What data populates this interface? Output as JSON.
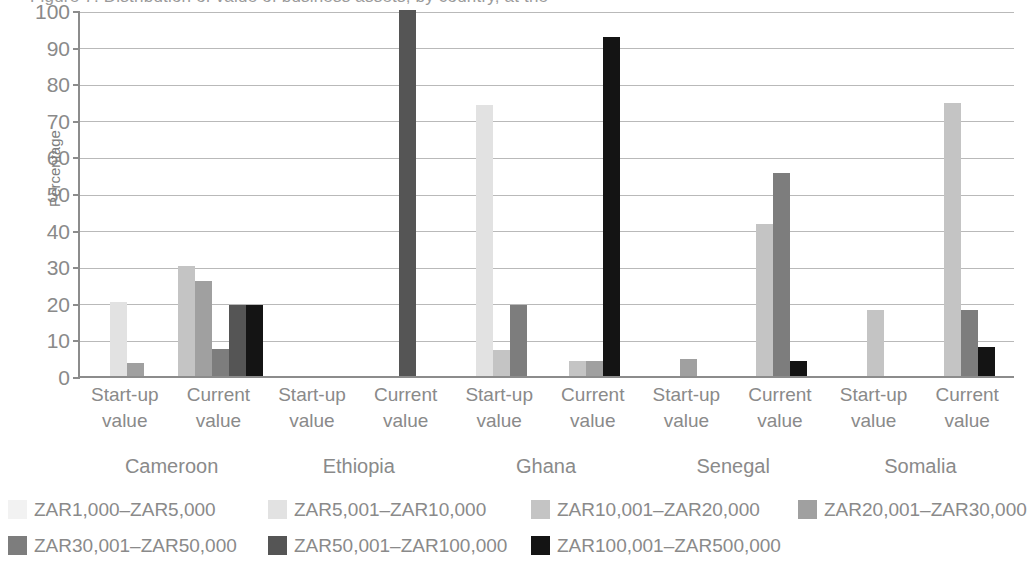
{
  "chart_data": {
    "type": "bar",
    "title": "Figure 7: Distribution of value of business assets, by country, at the",
    "xlabel": "",
    "ylabel": "Percentage",
    "ylim": [
      0,
      100
    ],
    "ytick_labels": [
      "0",
      "10",
      "20",
      "30",
      "40",
      "50",
      "60",
      "70",
      "80",
      "90",
      "100"
    ],
    "grid": true,
    "legend_position": "bottom",
    "series": [
      {
        "name": "ZAR1,000–ZAR5,000",
        "color": "#f2f2f2"
      },
      {
        "name": "ZAR5,001–ZAR10,000",
        "color": "#e2e2e2"
      },
      {
        "name": "ZAR10,001–ZAR20,000",
        "color": "#c4c4c4"
      },
      {
        "name": "ZAR20,001–ZAR30,000",
        "color": "#a0a0a0"
      },
      {
        "name": "ZAR30,001–ZAR50,000",
        "color": "#7d7d7d"
      },
      {
        "name": "ZAR50,001–ZAR100,000",
        "color": "#555555"
      },
      {
        "name": "ZAR100,001–ZAR500,000",
        "color": "#141414"
      }
    ],
    "countries": [
      "Cameroon",
      "Ethiopia",
      "Ghana",
      "Senegal",
      "Somalia"
    ],
    "measures": [
      "Start-up value",
      "Current value"
    ],
    "groups": [
      {
        "country": "Cameroon",
        "measure": "Start-up value",
        "tick_label_line1": "Start-up",
        "tick_label_line2": "value",
        "values": [
          0,
          20.2,
          0,
          3.6,
          0,
          0,
          0
        ]
      },
      {
        "country": "Cameroon",
        "measure": "Current value",
        "tick_label_line1": "Current",
        "tick_label_line2": "value",
        "values": [
          0,
          0,
          30.0,
          26.0,
          7.4,
          19.5,
          19.5
        ]
      },
      {
        "country": "Ethiopia",
        "measure": "Start-up value",
        "tick_label_line1": "Start-up",
        "tick_label_line2": "value",
        "values": [
          0,
          0,
          0,
          0,
          0,
          0,
          0
        ]
      },
      {
        "country": "Ethiopia",
        "measure": "Current value",
        "tick_label_line1": "Current",
        "tick_label_line2": "value",
        "values": [
          0,
          0,
          0,
          0,
          0,
          100.0,
          0
        ]
      },
      {
        "country": "Ghana",
        "measure": "Start-up value",
        "tick_label_line1": "Start-up",
        "tick_label_line2": "value",
        "values": [
          0,
          74.0,
          7.0,
          0,
          19.5,
          0,
          0
        ]
      },
      {
        "country": "Ghana",
        "measure": "Current value",
        "tick_label_line1": "Current",
        "tick_label_line2": "value",
        "values": [
          0,
          0,
          4.0,
          4.0,
          0,
          0,
          92.5
        ]
      },
      {
        "country": "Senegal",
        "measure": "Start-up value",
        "tick_label_line1": "Start-up",
        "tick_label_line2": "value",
        "values": [
          0,
          0,
          0,
          4.6,
          0,
          0,
          0
        ]
      },
      {
        "country": "Senegal",
        "measure": "Current value",
        "tick_label_line1": "Current",
        "tick_label_line2": "value",
        "values": [
          0,
          0,
          41.5,
          0,
          55.5,
          0,
          4.0
        ]
      },
      {
        "country": "Somalia",
        "measure": "Start-up value",
        "tick_label_line1": "Start-up",
        "tick_label_line2": "value",
        "values": [
          0,
          0,
          18.0,
          0,
          0,
          0,
          0
        ]
      },
      {
        "country": "Somalia",
        "measure": "Current value",
        "tick_label_line1": "Current",
        "tick_label_line2": "value",
        "values": [
          0,
          0,
          74.5,
          0,
          18.0,
          0,
          8.0
        ]
      }
    ]
  }
}
